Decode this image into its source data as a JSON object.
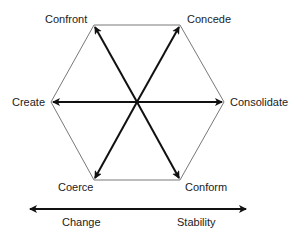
{
  "diagram": {
    "type": "hexagon-strategy-diagram",
    "vertices": {
      "confront": "Confront",
      "concede": "Concede",
      "create": "Create",
      "consolidate": "Consolidate",
      "coerce": "Coerce",
      "conform": "Conform"
    },
    "axis": {
      "left_label": "Change",
      "right_label": "Stability"
    },
    "colors": {
      "line": "#555555",
      "arrow": "#111111",
      "text": "#222222"
    }
  }
}
